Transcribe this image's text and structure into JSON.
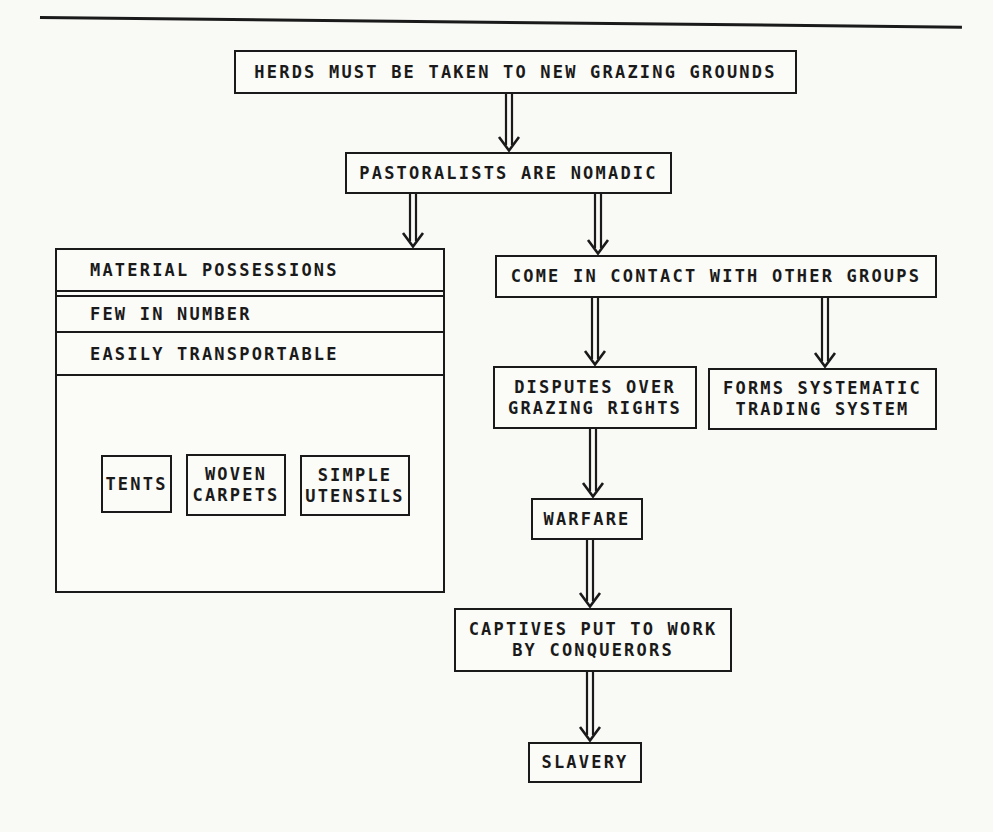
{
  "page": {
    "background_color": "#f9f9f6",
    "ink_color": "#1a1a1a"
  },
  "nodes": {
    "herds": {
      "label": "HERDS MUST BE TAKEN TO NEW GRAZING GROUNDS"
    },
    "pastoralists": {
      "label": "PASTORALISTS ARE NOMADIC"
    },
    "material_possessions": {
      "header": "MATERIAL POSSESSIONS",
      "row_few": "FEW IN NUMBER",
      "row_easily": "EASILY TRANSPORTABLE",
      "tents": {
        "label": "TENTS"
      },
      "woven_carpets": {
        "line1": "WOVEN",
        "line2": "CARPETS"
      },
      "simple_utensils": {
        "line1": "SIMPLE",
        "line2": "UTENSILS"
      }
    },
    "contact": {
      "label": "COME IN CONTACT WITH OTHER GROUPS"
    },
    "disputes": {
      "line1": "DISPUTES OVER",
      "line2": "GRAZING RIGHTS"
    },
    "trading": {
      "line1": "FORMS SYSTEMATIC",
      "line2": "TRADING SYSTEM"
    },
    "warfare": {
      "label": "WARFARE"
    },
    "captives": {
      "line1": "CAPTIVES PUT TO WORK",
      "line2": "BY CONQUERORS"
    },
    "slavery": {
      "label": "SLAVERY"
    }
  }
}
